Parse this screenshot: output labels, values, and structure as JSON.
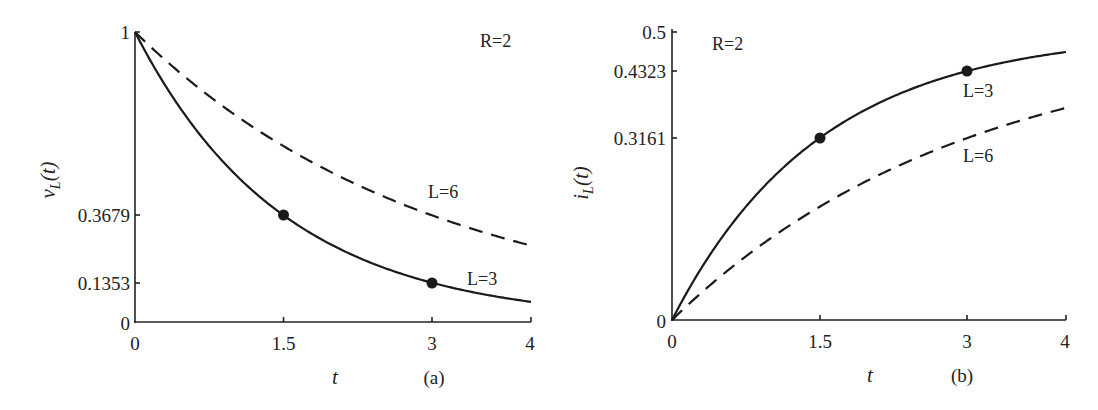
{
  "chart_data": [
    {
      "type": "line",
      "panel_label": "(a)",
      "title": "",
      "xlabel": "t",
      "ylabel": "v_L(t)",
      "xlim": [
        0,
        4
      ],
      "ylim": [
        0,
        1
      ],
      "grid": false,
      "x_ticks": [
        "0",
        "1.5",
        "3",
        "4"
      ],
      "y_ticks": [
        "0",
        "0.1353",
        "0.3679",
        "1"
      ],
      "annotations": [
        "R=2",
        "L=6",
        "L=3"
      ],
      "series": [
        {
          "name": "L=3",
          "style": "solid",
          "x": [
            0,
            0.5,
            1,
            1.5,
            2,
            2.5,
            3,
            3.5,
            4
          ],
          "values": [
            1,
            0.7165,
            0.5134,
            0.3679,
            0.2636,
            0.1889,
            0.1353,
            0.097,
            0.0695
          ]
        },
        {
          "name": "L=6",
          "style": "dashed",
          "x": [
            0,
            0.5,
            1,
            1.5,
            2,
            2.5,
            3,
            3.5,
            4
          ],
          "values": [
            1,
            0.8465,
            0.7165,
            0.6065,
            0.5134,
            0.4346,
            0.3679,
            0.3114,
            0.2636
          ]
        }
      ],
      "markers": [
        {
          "x": 1.5,
          "y": 0.3679,
          "series": "L=3"
        },
        {
          "x": 3,
          "y": 0.1353,
          "series": "L=3"
        }
      ]
    },
    {
      "type": "line",
      "panel_label": "(b)",
      "title": "",
      "xlabel": "t",
      "ylabel": "i_L(t)",
      "xlim": [
        0,
        4
      ],
      "ylim": [
        0,
        0.5
      ],
      "grid": false,
      "x_ticks": [
        "0",
        "1.5",
        "3",
        "4"
      ],
      "y_ticks": [
        "0",
        "0.3161",
        "0.4323",
        "0.5"
      ],
      "annotations": [
        "R=2",
        "L=3",
        "L=6"
      ],
      "series": [
        {
          "name": "L=3",
          "style": "solid",
          "x": [
            0,
            0.5,
            1,
            1.5,
            2,
            2.5,
            3,
            3.5,
            4
          ],
          "values": [
            0,
            0.1417,
            0.2433,
            0.3161,
            0.3682,
            0.4056,
            0.4323,
            0.4515,
            0.4653
          ]
        },
        {
          "name": "L=6",
          "style": "dashed",
          "x": [
            0,
            0.5,
            1,
            1.5,
            2,
            2.5,
            3,
            3.5,
            4
          ],
          "values": [
            0,
            0.0768,
            0.1417,
            0.1967,
            0.2433,
            0.2827,
            0.3161,
            0.3443,
            0.3682
          ]
        }
      ],
      "markers": [
        {
          "x": 1.5,
          "y": 0.3161,
          "series": "L=3"
        },
        {
          "x": 3,
          "y": 0.4323,
          "series": "L=3"
        }
      ]
    }
  ],
  "panels": {
    "a": {
      "ylabel_main": "v",
      "ylabel_sub": "L",
      "ylabel_arg": "(t)",
      "xlabel": "t",
      "caption": "(a)",
      "param": "R=2",
      "label_l6": "L=6",
      "label_l3": "L=3",
      "ticks_x": [
        "0",
        "1.5",
        "3",
        "4"
      ],
      "ticks_y": [
        "0",
        "0.1353",
        "0.3679",
        "1"
      ]
    },
    "b": {
      "ylabel_main": "i",
      "ylabel_sub": "L",
      "ylabel_arg": "(t)",
      "xlabel": "t",
      "caption": "(b)",
      "param": "R=2",
      "label_l3": "L=3",
      "label_l6": "L=6",
      "ticks_x": [
        "0",
        "1.5",
        "3",
        "4"
      ],
      "ticks_y": [
        "0",
        "0.3161",
        "0.4323",
        "0.5"
      ]
    }
  }
}
